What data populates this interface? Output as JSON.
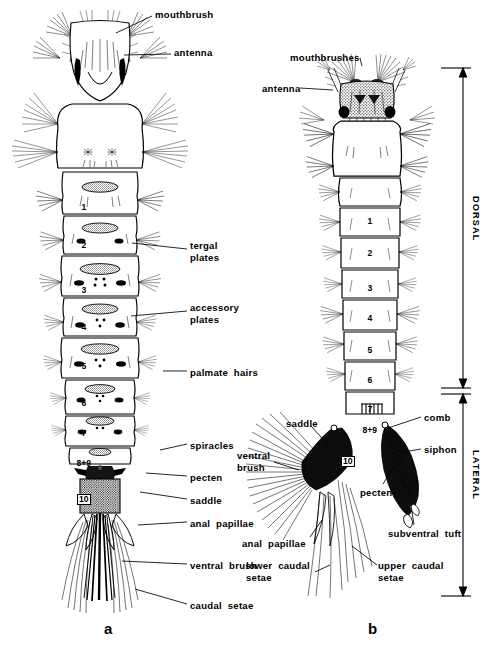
{
  "figure": {
    "background_color": "#ffffff",
    "ink_color": "#000000",
    "panels": [
      {
        "id": "a",
        "caption": "a",
        "view": "dorsal",
        "x": 108,
        "y": 628
      },
      {
        "id": "b",
        "caption": "b",
        "view": "lateral",
        "x": 372,
        "y": 628
      }
    ]
  },
  "brackets": [
    {
      "name": "dorsal-bracket",
      "label": "DORSAL",
      "axis_x": 463,
      "y_top": 68,
      "y_bottom": 388,
      "label_y": 196
    },
    {
      "name": "lateral-bracket",
      "label": "LATERAL",
      "axis_x": 463,
      "y_top": 394,
      "y_bottom": 596,
      "label_y": 450
    }
  ],
  "panel_a": {
    "labels": [
      {
        "name": "mouthbrush",
        "text": "mouthbrush",
        "x": 155,
        "y": 9,
        "align": "left",
        "leader": [
          [
            152,
            16
          ],
          [
            116,
            33
          ]
        ]
      },
      {
        "name": "antenna",
        "text": "antenna",
        "x": 174,
        "y": 47,
        "align": "left",
        "leader": [
          [
            171,
            54
          ],
          [
            124,
            55
          ]
        ]
      },
      {
        "name": "tergal-plates",
        "text": "tergal\nplates",
        "x": 190,
        "y": 240,
        "align": "left",
        "leader": [
          [
            187,
            249
          ],
          [
            132,
            243
          ]
        ]
      },
      {
        "name": "accessory-plates",
        "text": "accessory\nplates",
        "x": 190,
        "y": 302,
        "align": "left",
        "leader": [
          [
            187,
            311
          ],
          [
            131,
            316
          ]
        ]
      },
      {
        "name": "palmate-hairs",
        "text": "palmate  hairs",
        "x": 190,
        "y": 367,
        "align": "left",
        "leader": [
          [
            187,
            371
          ],
          [
            163,
            371
          ]
        ]
      },
      {
        "name": "spiracles",
        "text": "spiracles",
        "x": 190,
        "y": 440,
        "align": "left",
        "leader": [
          [
            187,
            444
          ],
          [
            160,
            450
          ]
        ]
      },
      {
        "name": "pecten",
        "text": "pecten",
        "x": 190,
        "y": 472,
        "align": "left",
        "leader": [
          [
            187,
            476
          ],
          [
            146,
            473
          ]
        ]
      },
      {
        "name": "saddle",
        "text": "saddle",
        "x": 190,
        "y": 495,
        "align": "left",
        "leader": [
          [
            187,
            499
          ],
          [
            140,
            492
          ]
        ]
      },
      {
        "name": "anal-papillae",
        "text": "anal  papillae",
        "x": 190,
        "y": 518,
        "align": "left",
        "leader": [
          [
            187,
            522
          ],
          [
            138,
            525
          ]
        ]
      },
      {
        "name": "ventral-brush",
        "text": "ventral  brush",
        "x": 190,
        "y": 560,
        "align": "left",
        "leader": [
          [
            187,
            564
          ],
          [
            122,
            561
          ]
        ]
      },
      {
        "name": "caudal-setae",
        "text": "caudal  setae",
        "x": 190,
        "y": 600,
        "align": "left",
        "leader": [
          [
            187,
            604
          ],
          [
            135,
            589
          ]
        ]
      }
    ],
    "segment_numbers": [
      {
        "label": "1",
        "x": 84,
        "y": 202
      },
      {
        "label": "2",
        "x": 84,
        "y": 240
      },
      {
        "label": "3",
        "x": 84,
        "y": 285
      },
      {
        "label": "4",
        "x": 84,
        "y": 322
      },
      {
        "label": "5",
        "x": 84,
        "y": 361
      },
      {
        "label": "6",
        "x": 84,
        "y": 398
      },
      {
        "label": "7",
        "x": 84,
        "y": 428
      },
      {
        "label": "8+9",
        "x": 84,
        "y": 458
      },
      {
        "label": "10",
        "x": 84,
        "y": 494,
        "boxed": true
      }
    ]
  },
  "panel_b": {
    "labels": [
      {
        "name": "mouthbrushes",
        "text": "mouthbrushes",
        "x": 290,
        "y": 52,
        "align": "left",
        "leader": [
          [
            360,
            58
          ],
          [
            362,
            66
          ]
        ]
      },
      {
        "name": "antenna",
        "text": "antenna",
        "x": 262,
        "y": 83,
        "align": "left",
        "leader": [
          [
            300,
            88
          ],
          [
            333,
            90
          ]
        ]
      },
      {
        "name": "saddle",
        "text": "saddle",
        "x": 286,
        "y": 418,
        "align": "left",
        "leader": [
          [
            311,
            426
          ],
          [
            330,
            447
          ]
        ]
      },
      {
        "name": "ventral-brush",
        "text": "ventral\nbrush",
        "x": 237,
        "y": 450,
        "align": "left",
        "leader": [
          [
            274,
            462
          ],
          [
            299,
            470
          ]
        ]
      },
      {
        "name": "anal-papillae",
        "text": "anal  papillae",
        "x": 242,
        "y": 538,
        "align": "left",
        "leader": [
          [
            310,
            537
          ],
          [
            322,
            520
          ]
        ]
      },
      {
        "name": "lower-caudal-setae",
        "text": "lower  caudal\nsetae",
        "x": 246,
        "y": 560,
        "align": "left",
        "leader": [
          [
            315,
            572
          ],
          [
            330,
            565
          ]
        ]
      },
      {
        "name": "comb",
        "text": "comb",
        "x": 424,
        "y": 412,
        "align": "left",
        "leader": [
          [
            421,
            417
          ],
          [
            388,
            428
          ]
        ]
      },
      {
        "name": "siphon",
        "text": "siphon",
        "x": 424,
        "y": 444,
        "align": "left",
        "leader": [
          [
            421,
            449
          ],
          [
            404,
            452
          ]
        ]
      },
      {
        "name": "pecten",
        "text": "pecten",
        "x": 360,
        "y": 487,
        "align": "left",
        "leader": [
          [
            383,
            484
          ],
          [
            394,
            466
          ]
        ]
      },
      {
        "name": "subventral-tuft",
        "text": "subventral  tuft",
        "x": 388,
        "y": 528,
        "align": "left",
        "leader": [
          [
            414,
            525
          ],
          [
            411,
            505
          ]
        ]
      },
      {
        "name": "upper-caudal-setae",
        "text": "upper  caudal\nsetae",
        "x": 378,
        "y": 560,
        "align": "left",
        "leader": [
          [
            377,
            565
          ],
          [
            352,
            546
          ]
        ]
      }
    ],
    "segment_numbers": [
      {
        "label": "1",
        "x": 370,
        "y": 216
      },
      {
        "label": "2",
        "x": 370,
        "y": 248
      },
      {
        "label": "3",
        "x": 370,
        "y": 283
      },
      {
        "label": "4",
        "x": 370,
        "y": 313
      },
      {
        "label": "5",
        "x": 370,
        "y": 345
      },
      {
        "label": "6",
        "x": 370,
        "y": 375
      },
      {
        "label": "7",
        "x": 370,
        "y": 404
      },
      {
        "label": "8+9",
        "x": 370,
        "y": 425
      },
      {
        "label": "10",
        "x": 348,
        "y": 456,
        "boxed": true
      }
    ]
  }
}
